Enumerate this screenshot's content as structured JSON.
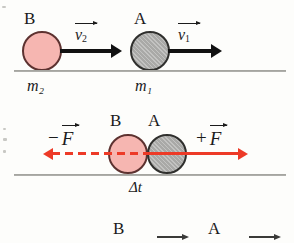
{
  "figure": {
    "colors": {
      "ball_b_fill": "#f6b6b1",
      "ball_b_stroke": "#5d3230",
      "ball_a_fill": "#a9a9a7",
      "ball_a_stroke": "#2f2f2d",
      "force_arrow": "#ed3a27",
      "velocity_arrow": "#111111",
      "ground_line": "#8d8d88",
      "background": "#fdfdfb"
    }
  },
  "panel_before": {
    "name": "before-collision",
    "ball_b_label": "B",
    "ball_a_label": "A",
    "ball_b_mass": "m₂",
    "ball_a_mass": "m₁",
    "velocity_b_symbol": "v",
    "velocity_b_subscript": "2",
    "velocity_a_symbol": "v",
    "velocity_a_subscript": "1"
  },
  "panel_contact": {
    "name": "during-collision",
    "ball_b_label": "B",
    "ball_a_label": "A",
    "force_left_sign": "−",
    "force_left_symbol": "F",
    "force_right_sign": "+",
    "force_right_symbol": "F",
    "duration_label": "Δt"
  },
  "panel_after": {
    "name": "after-collision-cropped",
    "ball_b_label": "B",
    "ball_a_label": "A"
  }
}
